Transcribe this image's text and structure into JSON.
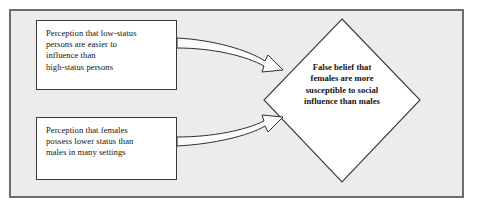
{
  "figure": {
    "type": "flow-diagram",
    "background_color": "#ececec",
    "page_color": "#ffffff",
    "border_color": "#6d6d6d",
    "node_fill": "#ffffff",
    "node_stroke": "#3a3a3a",
    "text_color": "#16120f"
  },
  "nodes": {
    "cause_1": {
      "shape": "rectangle",
      "lines": [
        "Perception that low-status",
        "persons are easier to",
        "influence than",
        "high-status persons"
      ]
    },
    "cause_2": {
      "shape": "rectangle",
      "lines": [
        "Perception that females",
        "possess lower status than",
        "males in many settings"
      ]
    },
    "outcome": {
      "shape": "diamond",
      "lines": [
        "False belief that",
        "females are more",
        "susceptible to social",
        "influence than males"
      ]
    }
  },
  "connectors": [
    {
      "name": "arrow-cause1-to-outcome",
      "from": "cause_1",
      "to": "outcome",
      "style": "block-arrow",
      "direction": "left-to-right"
    },
    {
      "name": "arrow-cause2-to-outcome",
      "from": "cause_2",
      "to": "outcome",
      "style": "block-arrow",
      "direction": "left-to-right"
    }
  ]
}
